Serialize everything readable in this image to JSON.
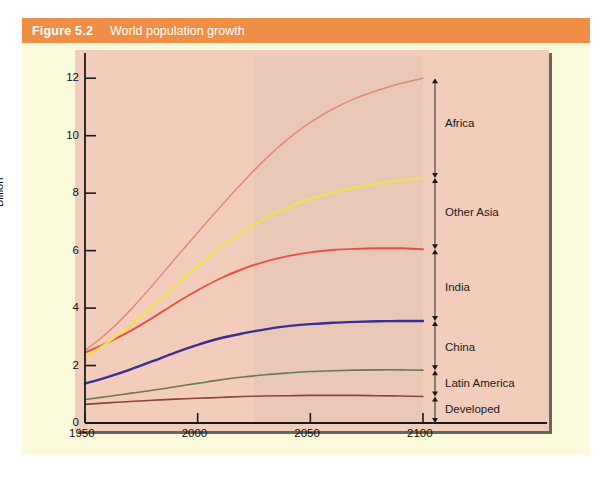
{
  "figure": {
    "number": "Figure 5.2",
    "title": "World population growth"
  },
  "colors": {
    "header_bar": "#ef8f47",
    "panel_background": "#fbfadb",
    "plot_background": "#f3cdbb",
    "shade_band": "#ddc4b6",
    "axis": "#1a1a1a",
    "africa": "#e08a72",
    "other_asia": "#f5e04a",
    "india": "#e8503a",
    "china": "#3b2f8f",
    "latin_america": "#6b7a52",
    "developed": "#8c4435"
  },
  "chart_data": {
    "type": "line",
    "title": "World population growth",
    "xlabel": "",
    "ylabel": "Billion",
    "xlim": [
      1950,
      2120
    ],
    "ylim": [
      0,
      12.6
    ],
    "xticks": [
      1950,
      2000,
      2050,
      2100
    ],
    "yticks": [
      0,
      2,
      4,
      6,
      8,
      10,
      12
    ],
    "grid": false,
    "legend_position": "right-bracket-labels",
    "note": "cumulative stacked totals; each line is the running total of regions below it",
    "x": [
      1950,
      1960,
      1970,
      1980,
      1990,
      2000,
      2010,
      2020,
      2030,
      2040,
      2050,
      2060,
      2070,
      2080,
      2090,
      2100
    ],
    "series": [
      {
        "name": "Developed",
        "color": "#8c4435",
        "values": [
          0.65,
          0.7,
          0.75,
          0.79,
          0.83,
          0.86,
          0.89,
          0.92,
          0.94,
          0.95,
          0.96,
          0.96,
          0.96,
          0.95,
          0.94,
          0.92
        ],
        "end_value": 0.92
      },
      {
        "name": "Latin America",
        "color": "#6b7a52",
        "values": [
          0.82,
          0.92,
          1.03,
          1.14,
          1.26,
          1.38,
          1.5,
          1.6,
          1.68,
          1.74,
          1.79,
          1.82,
          1.84,
          1.85,
          1.85,
          1.84
        ],
        "end_value": 1.84
      },
      {
        "name": "China",
        "color": "#3b2f8f",
        "values": [
          1.37,
          1.6,
          1.86,
          2.15,
          2.45,
          2.72,
          2.95,
          3.12,
          3.26,
          3.37,
          3.44,
          3.49,
          3.52,
          3.54,
          3.55,
          3.55
        ],
        "end_value": 3.55
      },
      {
        "name": "India",
        "color": "#e8503a",
        "values": [
          2.45,
          2.8,
          3.2,
          3.66,
          4.16,
          4.62,
          5.03,
          5.36,
          5.62,
          5.81,
          5.94,
          6.02,
          6.06,
          6.08,
          6.08,
          6.05
        ],
        "end_value": 6.05
      },
      {
        "name": "Other Asia",
        "color": "#f5e04a",
        "values": [
          2.28,
          2.8,
          3.4,
          4.08,
          4.78,
          5.46,
          6.1,
          6.66,
          7.13,
          7.5,
          7.8,
          8.03,
          8.2,
          8.34,
          8.45,
          8.53
        ],
        "end_value": 8.53
      },
      {
        "name": "Africa",
        "color": "#e08a72",
        "values": [
          2.52,
          3.15,
          3.92,
          4.8,
          5.72,
          6.63,
          7.52,
          8.38,
          9.18,
          9.88,
          10.46,
          10.93,
          11.3,
          11.58,
          11.82,
          12.0
        ],
        "end_value": 12.0
      }
    ],
    "bracket_labels": [
      {
        "name": "Africa",
        "from": 8.53,
        "to": 12.0,
        "label_at": 10.4
      },
      {
        "name": "Other Asia",
        "from": 6.05,
        "to": 8.53,
        "label_at": 7.3
      },
      {
        "name": "India",
        "from": 3.55,
        "to": 6.05,
        "label_at": 4.7
      },
      {
        "name": "China",
        "from": 1.84,
        "to": 3.55,
        "label_at": 2.6
      },
      {
        "name": "Latin America",
        "from": 0.92,
        "to": 1.84,
        "label_at": 1.35
      },
      {
        "name": "Developed",
        "from": 0.0,
        "to": 0.92,
        "label_at": 0.45
      }
    ],
    "shade_band": {
      "x_from": 2025,
      "x_to": 2100
    }
  }
}
